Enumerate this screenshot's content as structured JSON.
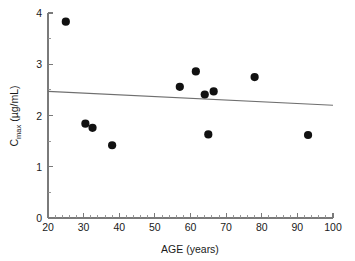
{
  "chart_data": {
    "type": "scatter",
    "title": "",
    "xlabel": "AGE (years)",
    "ylabel_main": "C",
    "ylabel_sub": "max",
    "ylabel_unit": " (µg/mL)",
    "ylabel": "Cmax (µg/mL)",
    "xlim": [
      20,
      100
    ],
    "ylim": [
      0,
      4
    ],
    "x_major_ticks": [
      20,
      30,
      40,
      50,
      60,
      70,
      80,
      90,
      100
    ],
    "y_major_ticks": [
      0,
      1,
      2,
      3,
      4
    ],
    "x_minor_step": 2,
    "y_minor_step": 0.5,
    "grid": false,
    "legend": null,
    "point_color": "#111111",
    "line_color": "#6f6f6f",
    "axis_color": "#7a7a7a",
    "points": [
      {
        "x": 25,
        "y": 3.83
      },
      {
        "x": 30.5,
        "y": 1.84
      },
      {
        "x": 32.5,
        "y": 1.76
      },
      {
        "x": 38,
        "y": 1.42
      },
      {
        "x": 57,
        "y": 2.56
      },
      {
        "x": 61.5,
        "y": 2.86
      },
      {
        "x": 64,
        "y": 2.41
      },
      {
        "x": 66.5,
        "y": 2.47
      },
      {
        "x": 65,
        "y": 1.63
      },
      {
        "x": 78,
        "y": 2.75
      },
      {
        "x": 93,
        "y": 1.62
      }
    ],
    "trend": {
      "x_start": 20,
      "y_start": 2.47,
      "x_end": 100,
      "y_end": 2.2
    }
  }
}
